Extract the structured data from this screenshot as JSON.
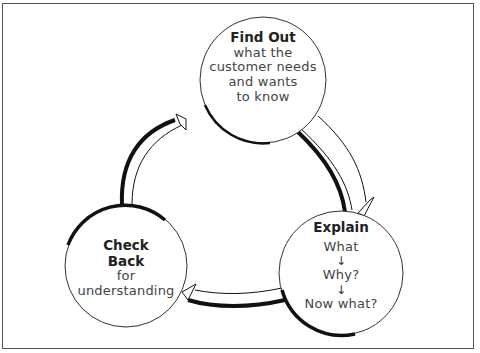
{
  "diagram": {
    "nodes": [
      {
        "id": "find-out",
        "title": "Find Out",
        "lines": [
          "what the",
          "customer needs",
          "and wants",
          "to know"
        ]
      },
      {
        "id": "explain",
        "title": "Explain",
        "steps": [
          "What",
          "Why?",
          "Now what?"
        ],
        "step_arrow": "↓"
      },
      {
        "id": "check-back",
        "title_lines": [
          "Check",
          "Back"
        ],
        "lines": [
          "for",
          "understanding"
        ]
      }
    ],
    "edges": [
      {
        "from": "find-out",
        "to": "explain"
      },
      {
        "from": "explain",
        "to": "check-back"
      },
      {
        "from": "check-back",
        "to": "find-out"
      }
    ],
    "colors": {
      "stroke": "#111111",
      "background": "#ffffff",
      "frame": "#555555"
    }
  }
}
